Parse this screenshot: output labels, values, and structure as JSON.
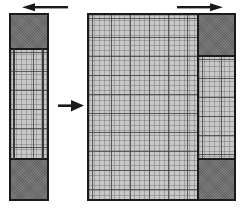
{
  "figure": {
    "colors": {
      "outline": "#1a1a1a",
      "hatch_fill": "#c8c8c8",
      "hatch_line": "#464646",
      "dark_block": "#6b6b6b",
      "background": "#ffffff"
    },
    "left_figure": {
      "name": "narrow-strip",
      "label": "",
      "top_arrow": {
        "name": "top-left-arrow",
        "direction": "left"
      },
      "segments": [
        {
          "name": "top-dark-block",
          "fill": "dark"
        },
        {
          "name": "middle-hatch-region",
          "fill": "hatch"
        },
        {
          "name": "bottom-dark-block",
          "fill": "dark"
        }
      ]
    },
    "transition_arrow": {
      "name": "transition-arrow",
      "direction": "right",
      "label": ""
    },
    "right_figure": {
      "name": "wide-block",
      "label": "",
      "top_arrow": {
        "name": "top-right-arrow",
        "direction": "right"
      },
      "main_region": {
        "name": "main-hatch-region",
        "fill": "hatch"
      },
      "side_column": {
        "name": "right-side-column",
        "segments": [
          {
            "name": "top-dark-block",
            "fill": "dark"
          },
          {
            "name": "middle-hatch-region",
            "fill": "hatch"
          },
          {
            "name": "bottom-dark-block",
            "fill": "dark"
          }
        ]
      }
    }
  }
}
